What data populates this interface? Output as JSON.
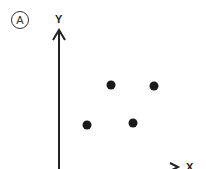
{
  "diagram": {
    "panel_label": "A",
    "y_axis_label": "Y",
    "x_axis_label": "X",
    "points": [
      {
        "x": 111,
        "y": 85
      },
      {
        "x": 154,
        "y": 86
      },
      {
        "x": 87,
        "y": 125
      },
      {
        "x": 133,
        "y": 123
      }
    ],
    "colors": {
      "axis": "#222222",
      "point": "#1a1a1a"
    }
  },
  "chart_data": {
    "type": "scatter",
    "title": "",
    "xlabel": "X",
    "ylabel": "Y",
    "panel": "A",
    "x": [
      2,
      4,
      1,
      3
    ],
    "y": [
      3,
      3,
      1,
      1
    ],
    "grid": false,
    "legend": null
  }
}
